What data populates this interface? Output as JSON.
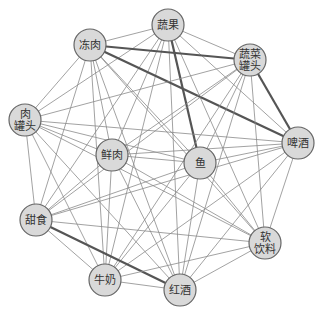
{
  "diagram": {
    "type": "network",
    "node_radius": 16,
    "nodes": [
      {
        "id": "shuguo",
        "lines": [
          "蔬果"
        ],
        "x": 168,
        "y": 25
      },
      {
        "id": "dongrou",
        "lines": [
          "冻肉"
        ],
        "x": 90,
        "y": 45
      },
      {
        "id": "shucaiguantou",
        "lines": [
          "蔬菜",
          "罐头"
        ],
        "x": 250,
        "y": 60
      },
      {
        "id": "rouguantou",
        "lines": [
          "肉",
          "罐头"
        ],
        "x": 25,
        "y": 120
      },
      {
        "id": "pijiu",
        "lines": [
          "啤酒"
        ],
        "x": 298,
        "y": 143
      },
      {
        "id": "xianrou",
        "lines": [
          "鲜肉"
        ],
        "x": 112,
        "y": 155
      },
      {
        "id": "yu",
        "lines": [
          "鱼"
        ],
        "x": 200,
        "y": 163
      },
      {
        "id": "tianshi",
        "lines": [
          "甜食"
        ],
        "x": 36,
        "y": 220
      },
      {
        "id": "ruanyinliao",
        "lines": [
          "软",
          "饮料"
        ],
        "x": 265,
        "y": 243
      },
      {
        "id": "niunai",
        "lines": [
          "牛奶"
        ],
        "x": 105,
        "y": 280
      },
      {
        "id": "hongjiu",
        "lines": [
          "红酒"
        ],
        "x": 180,
        "y": 290
      }
    ],
    "thick_edges": [
      [
        "dongrou",
        "shucaiguantou"
      ],
      [
        "dongrou",
        "pijiu"
      ],
      [
        "shuguo",
        "yu"
      ],
      [
        "shucaiguantou",
        "pijiu"
      ],
      [
        "tianshi",
        "hongjiu"
      ]
    ],
    "all_pairs_connected": true
  }
}
